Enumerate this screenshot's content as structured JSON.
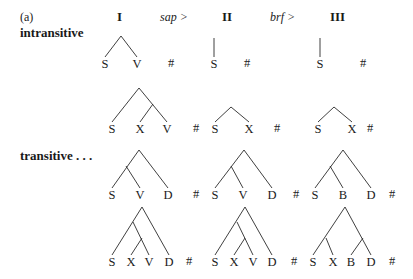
{
  "figure_label": "(a)",
  "columns": [
    {
      "label": "I"
    },
    {
      "label": "II"
    },
    {
      "label": "III"
    }
  ],
  "transitions": [
    {
      "label": "sap >"
    },
    {
      "label": "brf >"
    }
  ],
  "row_labels": {
    "intransitive": "intransitive",
    "transitive": "transitive . . ."
  },
  "boundary_symbol": "#",
  "trees": [
    {
      "id": "intr-1-I",
      "row": 0,
      "col": 0,
      "leaves": [
        "S",
        "V"
      ],
      "structure": "[S V]"
    },
    {
      "id": "intr-1-II",
      "row": 0,
      "col": 1,
      "leaves": [
        "S"
      ],
      "structure": "[S]"
    },
    {
      "id": "intr-1-III",
      "row": 0,
      "col": 2,
      "leaves": [
        "S"
      ],
      "structure": "[S]"
    },
    {
      "id": "intr-2-I",
      "row": 1,
      "col": 0,
      "leaves": [
        "S",
        "X",
        "V"
      ],
      "structure": "[S [X V]]"
    },
    {
      "id": "intr-2-II",
      "row": 1,
      "col": 1,
      "leaves": [
        "S",
        "X"
      ],
      "structure": "[S X]"
    },
    {
      "id": "intr-2-III",
      "row": 1,
      "col": 2,
      "leaves": [
        "S",
        "X"
      ],
      "structure": "[S X]"
    },
    {
      "id": "tr-1-I",
      "row": 2,
      "col": 0,
      "leaves": [
        "S",
        "V",
        "D"
      ],
      "structure": "[[S V] D]"
    },
    {
      "id": "tr-1-II",
      "row": 2,
      "col": 1,
      "leaves": [
        "S",
        "V",
        "D"
      ],
      "structure": "[[S V] D]"
    },
    {
      "id": "tr-1-III",
      "row": 2,
      "col": 2,
      "leaves": [
        "S",
        "B",
        "D"
      ],
      "structure": "[[S B] D]"
    },
    {
      "id": "tr-2-I",
      "row": 3,
      "col": 0,
      "leaves": [
        "S",
        "X",
        "V",
        "D"
      ],
      "structure": "[[S [X V]] D]"
    },
    {
      "id": "tr-2-II",
      "row": 3,
      "col": 1,
      "leaves": [
        "S",
        "X",
        "V",
        "D"
      ],
      "structure": "[[S [X V]] D]"
    },
    {
      "id": "tr-2-III",
      "row": 3,
      "col": 2,
      "leaves": [
        "S",
        "X",
        "B",
        "D"
      ],
      "structure": "[[S X] [B D]]"
    }
  ]
}
